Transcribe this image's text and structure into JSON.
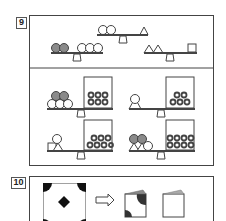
{
  "problems": [
    {
      "number": "9",
      "reference_scales": [
        {
          "left": [
            "circle",
            "circle"
          ],
          "right": [
            "triangle"
          ],
          "description": "2 circles balance 1 triangle"
        },
        {
          "left": [
            "gray-circle",
            "gray-circle"
          ],
          "right": [
            "circle",
            "circle",
            "circle"
          ],
          "description": "2 gray circles balance 3 circles"
        },
        {
          "left": [
            "triangle",
            "triangle"
          ],
          "right": [
            "square"
          ],
          "description": "2 triangles balance 1 square"
        }
      ],
      "answer_options": [
        {
          "left": [
            "gray-circle",
            "gray-circle",
            "circle",
            "circle",
            "circle"
          ],
          "right_box_rings": 6
        },
        {
          "left": [
            "triangle",
            "circle"
          ],
          "right_box_rings": 5
        },
        {
          "left": [
            "square",
            "triangle",
            "circle"
          ],
          "right_box_rings": 7
        },
        {
          "left": [
            "triangle",
            "triangle",
            "gray-circle",
            "gray-circle",
            "circle"
          ],
          "right_box_rings": 8
        }
      ]
    },
    {
      "number": "10",
      "source": "square with four black quarter-circle corners and black diamond in center",
      "arrow": "right-arrow",
      "options": [
        "folded-square-with-black-corners",
        "folded-square-plain"
      ]
    }
  ],
  "colors": {
    "stroke": "#444444",
    "gray_fill": "#8a8a8a",
    "black_fill": "#111111"
  }
}
